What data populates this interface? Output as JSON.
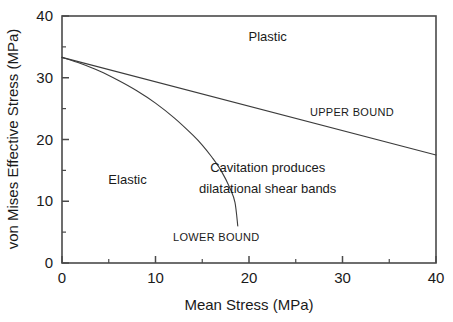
{
  "chart_data": {
    "type": "line",
    "title": "",
    "xlabel": "Mean Stress (MPa)",
    "ylabel": "von Mises Effective Stress (MPa)",
    "xlim": [
      0,
      40
    ],
    "ylim": [
      0,
      40
    ],
    "xticks": [
      0,
      10,
      20,
      30,
      40
    ],
    "yticks": [
      0,
      10,
      20,
      30,
      40
    ],
    "xtick_labels": [
      "0",
      "10",
      "20",
      "30",
      "40"
    ],
    "ytick_labels": [
      "0",
      "10",
      "20",
      "30",
      "40"
    ],
    "xminor_ticks": [
      5,
      15,
      25,
      35
    ],
    "yminor_ticks": [
      5,
      15,
      25,
      35
    ],
    "grid": false,
    "legend": "none",
    "series": [
      {
        "name": "UPPER BOUND",
        "points": [
          [
            0,
            33.3
          ],
          [
            40,
            17.5
          ]
        ]
      },
      {
        "name": "LOWER BOUND",
        "points": [
          [
            0,
            33.3
          ],
          [
            2,
            32.3
          ],
          [
            4,
            31.1
          ],
          [
            6,
            29.6
          ],
          [
            8,
            27.9
          ],
          [
            10,
            25.9
          ],
          [
            12,
            23.5
          ],
          [
            14,
            20.7
          ],
          [
            15,
            19.1
          ],
          [
            16,
            17.2
          ],
          [
            17,
            15.0
          ],
          [
            18,
            12.0
          ],
          [
            18.5,
            9.8
          ],
          [
            18.8,
            6.0
          ]
        ]
      }
    ],
    "annotations": [
      {
        "text": "Plastic",
        "x": 22.0,
        "y": 36.0,
        "style": "region"
      },
      {
        "text": "Elastic",
        "x": 7.0,
        "y": 12.8,
        "style": "region"
      },
      {
        "text": "UPPER BOUND",
        "x": 31.0,
        "y": 23.8,
        "style": "bound"
      },
      {
        "text": "LOWER BOUND",
        "x": 16.5,
        "y": 3.6,
        "style": "bound"
      },
      {
        "text": "Cavitation produces",
        "x": 22.0,
        "y": 14.8,
        "style": "region"
      },
      {
        "text": "dilatational shear bands",
        "x": 22.0,
        "y": 11.4,
        "style": "region"
      }
    ]
  },
  "labels": {
    "x_axis_title": "Mean Stress (MPa)",
    "y_axis_title": "von Mises Effective Stress (MPa)",
    "plastic": "Plastic",
    "elastic": "Elastic",
    "upper_bound": "UPPER BOUND",
    "lower_bound": "LOWER BOUND",
    "cavitation_line1": "Cavitation produces",
    "cavitation_line2": "dilatational shear bands"
  },
  "ticks": {
    "x": [
      "0",
      "10",
      "20",
      "30",
      "40"
    ],
    "y": [
      "0",
      "10",
      "20",
      "30",
      "40"
    ]
  },
  "colors": {
    "background": "#ffffff",
    "axis": "#4a4a4a",
    "curve": "#3c3c3c",
    "text": "#1a1a1a"
  }
}
